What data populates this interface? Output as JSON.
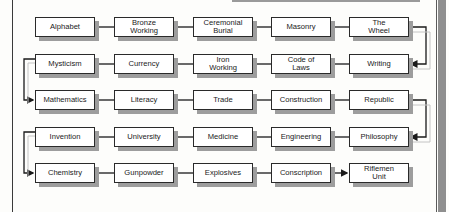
{
  "diagram": {
    "type": "tech-tree",
    "rows": [
      [
        "Alphabet",
        "Bronze\nWorking",
        "Ceremonial\nBurial",
        "Masonry",
        "The\nWheel"
      ],
      [
        "Mysticism",
        "Currency",
        "Iron\nWorking",
        "Code of\nLaws",
        "Writing"
      ],
      [
        "Mathematics",
        "Literacy",
        "Trade",
        "Construction",
        "Republic"
      ],
      [
        "Invention",
        "University",
        "Medicine",
        "Engineering",
        "Philosophy"
      ],
      [
        "Chemistry",
        "Gunpowder",
        "Explosives",
        "Conscription",
        "Riflemen\nUnit"
      ]
    ],
    "flow": "serpentine",
    "edges": [
      {
        "from": "The Wheel",
        "to": "Writing",
        "arrow": true
      },
      {
        "from": "Mysticism",
        "to": "Mathematics",
        "arrow": true
      },
      {
        "from": "Republic",
        "to": "Philosophy",
        "arrow": true
      },
      {
        "from": "Invention",
        "to": "Chemistry",
        "arrow": true
      },
      {
        "from": "Conscription",
        "to": "Riflemen Unit",
        "arrow": true
      }
    ]
  }
}
